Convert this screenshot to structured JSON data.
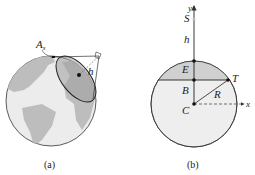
{
  "figure_a": {
    "caption": "(a)",
    "labels": {
      "station": "A",
      "station_sub": "s",
      "satellite": "A",
      "height": "h"
    },
    "colors": {
      "land": "#bdbdbd",
      "ocean": "#ececec",
      "coverage": "#9e9e9e",
      "outline": "#333333"
    }
  },
  "figure_b": {
    "caption": "(b)",
    "labels": {
      "y_axis": "y",
      "x_axis": "x",
      "satellite": "S",
      "height": "h",
      "E": "E",
      "B": "B",
      "T": "T",
      "R": "R",
      "C": "C"
    },
    "colors": {
      "cap": "#d0d0d0",
      "body": "#eeeeee",
      "outline": "#333333"
    }
  }
}
